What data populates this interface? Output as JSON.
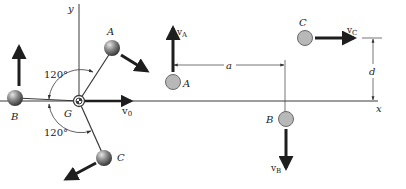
{
  "figure": {
    "colors": {
      "line": "#3a3a3a",
      "arrow": "#1e1e1e",
      "sphere_dark": "#2e2e2e",
      "sphere_light": "#e6e6e6",
      "circle_fill": "#b8b8b8",
      "circle_stroke": "#6a6a6a",
      "background": "#ffffff"
    },
    "axes": {
      "x_label": "x",
      "y_label": "y"
    },
    "left_panel": {
      "center_label": "G",
      "center_velocity_label": "v",
      "center_velocity_sub": "0",
      "angle_upper": "120°",
      "angle_lower": "120°",
      "spheres": [
        {
          "label": "A"
        },
        {
          "label": "B"
        },
        {
          "label": "C"
        }
      ]
    },
    "right_panel": {
      "particles": [
        {
          "label": "A",
          "velocity_label": "v",
          "velocity_sub": "A"
        },
        {
          "label": "B",
          "velocity_label": "v",
          "velocity_sub": "B"
        },
        {
          "label": "C",
          "velocity_label": "v",
          "velocity_sub": "C"
        }
      ],
      "dim_horizontal": "a",
      "dim_vertical": "d"
    }
  }
}
